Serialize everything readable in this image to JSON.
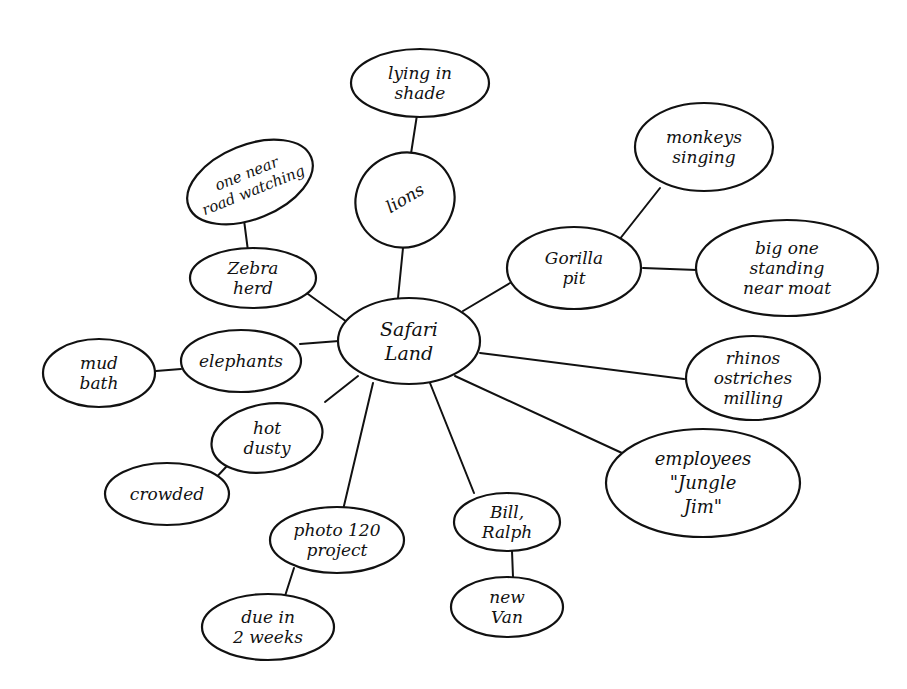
{
  "diagram": {
    "type": "cluster-map",
    "style": "hand-drawn",
    "center": {
      "id": "center",
      "lines": [
        "Safari",
        "Land"
      ]
    },
    "nodes": [
      {
        "id": "lions",
        "lines": [
          "lions"
        ]
      },
      {
        "id": "lying",
        "lines": [
          "lying in",
          "shade"
        ]
      },
      {
        "id": "zebra",
        "lines": [
          "Zebra",
          "herd"
        ]
      },
      {
        "id": "road",
        "lines": [
          "one near",
          "road watching"
        ]
      },
      {
        "id": "elephants",
        "lines": [
          "elephants"
        ]
      },
      {
        "id": "mud",
        "lines": [
          "mud",
          "bath"
        ]
      },
      {
        "id": "hot",
        "lines": [
          "hot",
          "dusty"
        ]
      },
      {
        "id": "crowded",
        "lines": [
          "crowded"
        ]
      },
      {
        "id": "photo",
        "lines": [
          "photo 120",
          "project"
        ]
      },
      {
        "id": "due",
        "lines": [
          "due in",
          "2 weeks"
        ]
      },
      {
        "id": "bill",
        "lines": [
          "Bill,",
          "Ralph"
        ]
      },
      {
        "id": "van",
        "lines": [
          "new",
          "Van"
        ]
      },
      {
        "id": "gorilla",
        "lines": [
          "Gorilla",
          "pit"
        ]
      },
      {
        "id": "monkeys",
        "lines": [
          "monkeys",
          "singing"
        ]
      },
      {
        "id": "bigone",
        "lines": [
          "big one",
          "standing",
          "near moat"
        ]
      },
      {
        "id": "rhinos",
        "lines": [
          "rhinos",
          "ostriches",
          "milling"
        ]
      },
      {
        "id": "employees",
        "lines": [
          "employees",
          "\"Jungle",
          "Jim\""
        ]
      }
    ],
    "edges": [
      [
        "center",
        "lions"
      ],
      [
        "lions",
        "lying"
      ],
      [
        "center",
        "zebra"
      ],
      [
        "zebra",
        "road"
      ],
      [
        "center",
        "elephants"
      ],
      [
        "elephants",
        "mud"
      ],
      [
        "center",
        "hot"
      ],
      [
        "hot",
        "crowded"
      ],
      [
        "center",
        "photo"
      ],
      [
        "photo",
        "due"
      ],
      [
        "center",
        "bill"
      ],
      [
        "bill",
        "van"
      ],
      [
        "center",
        "gorilla"
      ],
      [
        "gorilla",
        "monkeys"
      ],
      [
        "gorilla",
        "bigone"
      ],
      [
        "center",
        "rhinos"
      ],
      [
        "center",
        "employees"
      ]
    ]
  }
}
